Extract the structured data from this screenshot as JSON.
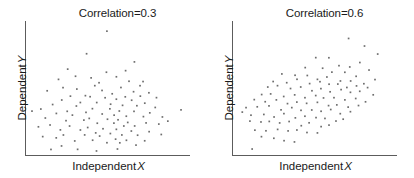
{
  "figure": {
    "width": 414,
    "height": 178,
    "background": "#ffffff",
    "point_color": "#6e6e6e",
    "axis_color": "#5c5c5c",
    "text_color": "#1a1a1a"
  },
  "panels": [
    {
      "id": "panel-left",
      "title": "Correlation=0.3",
      "xlabel_text": "Independent",
      "xlabel_var": "X",
      "ylabel_text": "Dependent",
      "ylabel_var": "Y"
    },
    {
      "id": "panel-right",
      "title": "Correlation=0.6",
      "xlabel_text": "Independent",
      "xlabel_var": "X",
      "ylabel_text": "Dependent",
      "ylabel_var": "Y"
    }
  ],
  "chart_data": [
    {
      "type": "scatter",
      "title": "Correlation=0.3",
      "xlabel": "Independent X",
      "ylabel": "Dependent Y",
      "correlation": 0.3,
      "n_points": 200,
      "grid": false,
      "legend": "none",
      "axis_ticks": "none",
      "xlim": [
        0,
        1
      ],
      "ylim": [
        0,
        1
      ],
      "marker": {
        "shape": "square",
        "size_px": 1.7,
        "color": "#6e6e6e"
      },
      "points": [
        [
          0.49,
          0.93
        ],
        [
          0.36,
          0.76
        ],
        [
          0.66,
          0.7
        ],
        [
          0.25,
          0.66
        ],
        [
          0.49,
          0.62
        ],
        [
          0.59,
          0.64
        ],
        [
          0.62,
          0.56
        ],
        [
          0.19,
          0.57
        ],
        [
          0.29,
          0.6
        ],
        [
          0.39,
          0.58
        ],
        [
          0.44,
          0.55
        ],
        [
          0.55,
          0.59
        ],
        [
          0.68,
          0.53
        ],
        [
          0.71,
          0.55
        ],
        [
          0.13,
          0.49
        ],
        [
          0.22,
          0.52
        ],
        [
          0.31,
          0.5
        ],
        [
          0.35,
          0.46
        ],
        [
          0.41,
          0.52
        ],
        [
          0.46,
          0.49
        ],
        [
          0.52,
          0.47
        ],
        [
          0.57,
          0.51
        ],
        [
          0.6,
          0.45
        ],
        [
          0.64,
          0.48
        ],
        [
          0.69,
          0.44
        ],
        [
          0.74,
          0.48
        ],
        [
          0.79,
          0.43
        ],
        [
          0.21,
          0.42
        ],
        [
          0.27,
          0.45
        ],
        [
          0.33,
          0.41
        ],
        [
          0.38,
          0.44
        ],
        [
          0.43,
          0.4
        ],
        [
          0.47,
          0.43
        ],
        [
          0.51,
          0.39
        ],
        [
          0.54,
          0.42
        ],
        [
          0.58,
          0.38
        ],
        [
          0.63,
          0.41
        ],
        [
          0.67,
          0.37
        ],
        [
          0.72,
          0.4
        ],
        [
          0.77,
          0.36
        ],
        [
          0.09,
          0.36
        ],
        [
          0.16,
          0.38
        ],
        [
          0.24,
          0.34
        ],
        [
          0.3,
          0.37
        ],
        [
          0.36,
          0.33
        ],
        [
          0.4,
          0.36
        ],
        [
          0.45,
          0.32
        ],
        [
          0.5,
          0.35
        ],
        [
          0.53,
          0.31
        ],
        [
          0.56,
          0.34
        ],
        [
          0.61,
          0.3
        ],
        [
          0.65,
          0.33
        ],
        [
          0.7,
          0.29
        ],
        [
          0.75,
          0.32
        ],
        [
          0.82,
          0.3
        ],
        [
          0.93,
          0.34
        ],
        [
          0.03,
          0.33
        ],
        [
          0.12,
          0.28
        ],
        [
          0.18,
          0.31
        ],
        [
          0.23,
          0.27
        ],
        [
          0.28,
          0.3
        ],
        [
          0.34,
          0.26
        ],
        [
          0.37,
          0.29
        ],
        [
          0.42,
          0.25
        ],
        [
          0.48,
          0.28
        ],
        [
          0.52,
          0.24
        ],
        [
          0.55,
          0.27
        ],
        [
          0.59,
          0.23
        ],
        [
          0.62,
          0.26
        ],
        [
          0.66,
          0.22
        ],
        [
          0.73,
          0.25
        ],
        [
          0.8,
          0.23
        ],
        [
          0.86,
          0.26
        ],
        [
          0.07,
          0.22
        ],
        [
          0.14,
          0.24
        ],
        [
          0.2,
          0.2
        ],
        [
          0.26,
          0.23
        ],
        [
          0.32,
          0.19
        ],
        [
          0.37,
          0.22
        ],
        [
          0.41,
          0.18
        ],
        [
          0.46,
          0.21
        ],
        [
          0.5,
          0.17
        ],
        [
          0.54,
          0.2
        ],
        [
          0.58,
          0.16
        ],
        [
          0.63,
          0.19
        ],
        [
          0.68,
          0.15
        ],
        [
          0.74,
          0.18
        ],
        [
          0.81,
          0.16
        ],
        [
          0.1,
          0.15
        ],
        [
          0.17,
          0.13
        ],
        [
          0.23,
          0.16
        ],
        [
          0.29,
          0.12
        ],
        [
          0.35,
          0.15
        ],
        [
          0.4,
          0.11
        ],
        [
          0.45,
          0.14
        ],
        [
          0.49,
          0.1
        ],
        [
          0.53,
          0.13
        ],
        [
          0.57,
          0.09
        ],
        [
          0.61,
          0.12
        ],
        [
          0.67,
          0.08
        ],
        [
          0.72,
          0.11
        ],
        [
          0.3,
          0.05
        ],
        [
          0.43,
          0.03
        ],
        [
          0.55,
          0.06
        ],
        [
          0.21,
          0.07
        ],
        [
          0.15,
          0.05
        ]
      ]
    },
    {
      "type": "scatter",
      "title": "Correlation=0.6",
      "xlabel": "Independent X",
      "ylabel": "Dependent Y",
      "correlation": 0.6,
      "n_points": 200,
      "grid": false,
      "legend": "none",
      "axis_ticks": "none",
      "xlim": [
        0,
        1
      ],
      "ylim": [
        0,
        1
      ],
      "marker": {
        "shape": "square",
        "size_px": 1.7,
        "color": "#6e6e6e"
      },
      "points": [
        [
          0.7,
          0.89
        ],
        [
          0.8,
          0.82
        ],
        [
          0.88,
          0.76
        ],
        [
          0.76,
          0.71
        ],
        [
          0.58,
          0.74
        ],
        [
          0.49,
          0.73
        ],
        [
          0.63,
          0.68
        ],
        [
          0.71,
          0.66
        ],
        [
          0.82,
          0.64
        ],
        [
          0.43,
          0.67
        ],
        [
          0.53,
          0.65
        ],
        [
          0.6,
          0.63
        ],
        [
          0.67,
          0.62
        ],
        [
          0.74,
          0.6
        ],
        [
          0.29,
          0.62
        ],
        [
          0.37,
          0.6
        ],
        [
          0.45,
          0.61
        ],
        [
          0.51,
          0.58
        ],
        [
          0.57,
          0.59
        ],
        [
          0.64,
          0.57
        ],
        [
          0.7,
          0.56
        ],
        [
          0.78,
          0.55
        ],
        [
          0.85,
          0.58
        ],
        [
          0.24,
          0.56
        ],
        [
          0.32,
          0.55
        ],
        [
          0.39,
          0.57
        ],
        [
          0.46,
          0.54
        ],
        [
          0.52,
          0.56
        ],
        [
          0.58,
          0.53
        ],
        [
          0.63,
          0.54
        ],
        [
          0.69,
          0.52
        ],
        [
          0.75,
          0.53
        ],
        [
          0.81,
          0.51
        ],
        [
          0.2,
          0.51
        ],
        [
          0.27,
          0.52
        ],
        [
          0.34,
          0.5
        ],
        [
          0.41,
          0.51
        ],
        [
          0.47,
          0.49
        ],
        [
          0.53,
          0.5
        ],
        [
          0.59,
          0.48
        ],
        [
          0.65,
          0.49
        ],
        [
          0.71,
          0.47
        ],
        [
          0.77,
          0.48
        ],
        [
          0.84,
          0.46
        ],
        [
          0.16,
          0.46
        ],
        [
          0.23,
          0.47
        ],
        [
          0.3,
          0.45
        ],
        [
          0.36,
          0.46
        ],
        [
          0.43,
          0.44
        ],
        [
          0.49,
          0.45
        ],
        [
          0.55,
          0.43
        ],
        [
          0.61,
          0.44
        ],
        [
          0.67,
          0.42
        ],
        [
          0.73,
          0.43
        ],
        [
          0.79,
          0.41
        ],
        [
          0.12,
          0.42
        ],
        [
          0.19,
          0.41
        ],
        [
          0.26,
          0.42
        ],
        [
          0.33,
          0.4
        ],
        [
          0.39,
          0.41
        ],
        [
          0.45,
          0.39
        ],
        [
          0.51,
          0.4
        ],
        [
          0.57,
          0.38
        ],
        [
          0.63,
          0.39
        ],
        [
          0.69,
          0.37
        ],
        [
          0.75,
          0.38
        ],
        [
          0.08,
          0.37
        ],
        [
          0.15,
          0.36
        ],
        [
          0.22,
          0.37
        ],
        [
          0.29,
          0.35
        ],
        [
          0.35,
          0.36
        ],
        [
          0.41,
          0.34
        ],
        [
          0.47,
          0.35
        ],
        [
          0.53,
          0.33
        ],
        [
          0.59,
          0.34
        ],
        [
          0.65,
          0.32
        ],
        [
          0.71,
          0.33
        ],
        [
          0.05,
          0.32
        ],
        [
          0.11,
          0.31
        ],
        [
          0.18,
          0.32
        ],
        [
          0.25,
          0.3
        ],
        [
          0.31,
          0.31
        ],
        [
          0.37,
          0.29
        ],
        [
          0.43,
          0.3
        ],
        [
          0.49,
          0.28
        ],
        [
          0.55,
          0.29
        ],
        [
          0.61,
          0.27
        ],
        [
          0.67,
          0.28
        ],
        [
          0.09,
          0.26
        ],
        [
          0.16,
          0.25
        ],
        [
          0.22,
          0.26
        ],
        [
          0.28,
          0.24
        ],
        [
          0.34,
          0.25
        ],
        [
          0.4,
          0.23
        ],
        [
          0.46,
          0.24
        ],
        [
          0.52,
          0.22
        ],
        [
          0.58,
          0.23
        ],
        [
          0.13,
          0.2
        ],
        [
          0.2,
          0.19
        ],
        [
          0.26,
          0.2
        ],
        [
          0.32,
          0.18
        ],
        [
          0.38,
          0.19
        ],
        [
          0.44,
          0.17
        ],
        [
          0.5,
          0.18
        ],
        [
          0.17,
          0.14
        ],
        [
          0.24,
          0.13
        ],
        [
          0.3,
          0.12
        ],
        [
          0.36,
          0.11
        ],
        [
          0.11,
          0.05
        ]
      ]
    }
  ]
}
